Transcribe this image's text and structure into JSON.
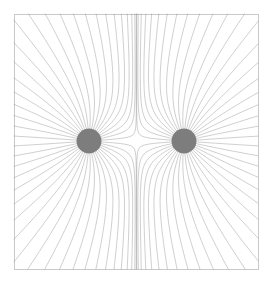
{
  "figure": {
    "width": 273,
    "height": 286,
    "background_color": "#ffffff"
  },
  "frame": {
    "x": 14,
    "y": 14,
    "width": 244,
    "height": 255,
    "stroke_color": "#c9c9c9",
    "stroke_width": 1
  },
  "style": {
    "line_color": "#8c8c8c",
    "line_width": 0.42,
    "charge_fill": "#7d7d7d"
  },
  "chart_data": {
    "type": "line",
    "subtitle": "",
    "xlabel": "",
    "ylabel": "",
    "grid": false,
    "legend": null,
    "xlim": [
      14,
      258
    ],
    "ylim": [
      14,
      269
    ],
    "axis_visible": false,
    "symmetry": {
      "horizontal_axis_y": 141,
      "vertical_axis_x": 136.5,
      "mirror_x": true,
      "mirror_y": true
    },
    "charges": [
      {
        "name": "left-charge",
        "cx": 89,
        "cy": 141,
        "radius": 12.5,
        "sign": 1,
        "magnitude": 1,
        "fill": "#7d7d7d"
      },
      {
        "name": "right-charge",
        "cx": 184,
        "cy": 141,
        "radius": 12.5,
        "sign": 1,
        "magnitude": 1,
        "fill": "#7d7d7d"
      }
    ],
    "field_lines": {
      "count_per_charge": 44,
      "seed_radius": 12.5,
      "step_size": 0.9,
      "max_steps": 1400,
      "description": "Streamlines of the electric field of two equal positive point charges, seeded uniformly around each charge surface and integrated outward until leaving the frame."
    }
  }
}
